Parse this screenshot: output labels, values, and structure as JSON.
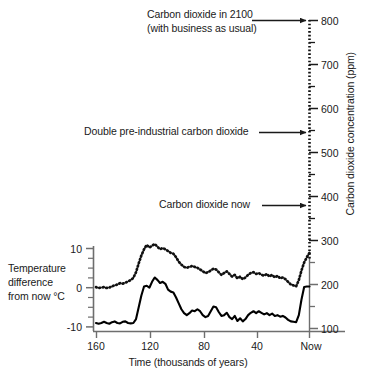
{
  "chart_data": {
    "type": "line",
    "title": "",
    "xlabel": "Time (thousands of years)",
    "x_tick_labels": [
      "160",
      "120",
      "80",
      "40",
      "Now"
    ],
    "x_tick_values": [
      160,
      120,
      80,
      40,
      0
    ],
    "xlim": [
      165,
      0
    ],
    "left_axis": {
      "label": "Temperature difference from now °C",
      "label_line1": "Temperature",
      "label_line2": "difference",
      "label_line3": "from now °C",
      "ticks": [
        10,
        0,
        -10
      ],
      "tick_labels": [
        "10",
        "0",
        "-10"
      ],
      "minor_tick_step": 2.5,
      "ylim": [
        -11.2,
        12.0
      ],
      "units": "°C"
    },
    "right_axis": {
      "label": "Carbon dioxide concentration (ppm)",
      "ticks": [
        800,
        700,
        600,
        500,
        400,
        300,
        200,
        100
      ],
      "tick_labels": [
        "800",
        "700",
        "600",
        "500",
        "400",
        "300",
        "200",
        "100"
      ],
      "minor_ticks": [
        750,
        650,
        550,
        450,
        350,
        250,
        150
      ],
      "ylim": [
        100,
        810
      ],
      "units": "ppm"
    },
    "grid": false,
    "legend_position": "none",
    "series": [
      {
        "name": "Temperature difference from now",
        "style": "solid",
        "color": "#000000",
        "axis": "left",
        "units": "°C",
        "x": [
          160,
          158,
          156,
          154,
          152,
          150,
          148,
          146,
          144,
          142,
          140,
          138,
          136,
          134,
          132,
          130,
          128,
          126,
          124,
          122,
          120,
          118,
          116,
          114,
          112,
          110,
          108,
          106,
          104,
          102,
          100,
          98,
          96,
          94,
          92,
          90,
          88,
          86,
          84,
          82,
          80,
          78,
          76,
          74,
          72,
          70,
          68,
          66,
          64,
          62,
          60,
          58,
          56,
          54,
          52,
          50,
          48,
          46,
          44,
          42,
          40,
          38,
          36,
          34,
          32,
          30,
          28,
          26,
          24,
          22,
          20,
          18,
          16,
          14,
          12,
          10,
          8,
          6,
          4,
          2,
          0
        ],
        "y": [
          -9.0,
          -9.2,
          -9.0,
          -8.7,
          -9.0,
          -9.2,
          -8.8,
          -8.6,
          -9.0,
          -9.1,
          -8.7,
          -8.6,
          -9.0,
          -9.1,
          -9.0,
          -8.0,
          -5.0,
          -2.0,
          0.3,
          0.5,
          0.0,
          1.5,
          2.6,
          2.0,
          1.2,
          1.5,
          1.0,
          -0.5,
          -1.0,
          -1.2,
          -2.5,
          -4.0,
          -5.5,
          -6.5,
          -7.0,
          -6.5,
          -5.8,
          -6.0,
          -5.5,
          -6.0,
          -7.0,
          -7.5,
          -7.2,
          -6.0,
          -4.8,
          -5.0,
          -6.2,
          -7.2,
          -7.0,
          -6.4,
          -7.5,
          -8.0,
          -7.2,
          -8.5,
          -7.8,
          -8.6,
          -8.0,
          -7.0,
          -6.4,
          -6.0,
          -6.5,
          -6.0,
          -6.4,
          -6.8,
          -6.5,
          -7.0,
          -6.6,
          -7.2,
          -7.0,
          -7.4,
          -7.2,
          -7.6,
          -8.2,
          -8.6,
          -8.7,
          -8.8,
          -7.0,
          -3.0,
          0.2,
          0.3,
          0.3
        ]
      },
      {
        "name": "Carbon dioxide concentration",
        "style": "dotted",
        "color": "#000000",
        "axis": "right",
        "units": "ppm",
        "x": [
          160,
          158,
          156,
          154,
          152,
          150,
          148,
          146,
          144,
          142,
          140,
          138,
          136,
          134,
          132,
          130,
          128,
          126,
          124,
          122,
          120,
          118,
          116,
          114,
          112,
          110,
          108,
          106,
          104,
          102,
          100,
          98,
          96,
          94,
          92,
          90,
          88,
          86,
          84,
          82,
          80,
          78,
          76,
          74,
          72,
          70,
          68,
          66,
          64,
          62,
          60,
          58,
          56,
          54,
          52,
          50,
          48,
          46,
          44,
          42,
          40,
          38,
          36,
          34,
          32,
          30,
          28,
          26,
          24,
          22,
          20,
          18,
          16,
          14,
          12,
          10,
          8,
          6,
          4,
          2,
          0
        ],
        "y": [
          194,
          192,
          193,
          194,
          192,
          193,
          196,
          198,
          200,
          203,
          202,
          204,
          207,
          210,
          215,
          228,
          248,
          266,
          280,
          290,
          284,
          288,
          292,
          286,
          280,
          283,
          280,
          276,
          272,
          270,
          262,
          252,
          245,
          240,
          238,
          240,
          242,
          240,
          238,
          234,
          230,
          226,
          228,
          232,
          236,
          234,
          228,
          222,
          226,
          230,
          224,
          218,
          222,
          214,
          218,
          212,
          216,
          222,
          226,
          228,
          224,
          226,
          222,
          220,
          224,
          218,
          222,
          216,
          220,
          214,
          216,
          212,
          206,
          200,
          198,
          196,
          210,
          232,
          250,
          262,
          272
        ]
      }
    ],
    "annotations": [
      {
        "name": "carbon-dioxide-2100",
        "line1": "Carbon dioxide in 2100",
        "line2": "(with business as usual)",
        "points_to_ppm": 800
      },
      {
        "name": "double-pre-industrial",
        "line1": "Double pre-industrial carbon dioxide",
        "points_to_ppm": 560
      },
      {
        "name": "carbon-dioxide-now",
        "line1": "Carbon dioxide now",
        "points_to_ppm": 385
      }
    ]
  }
}
